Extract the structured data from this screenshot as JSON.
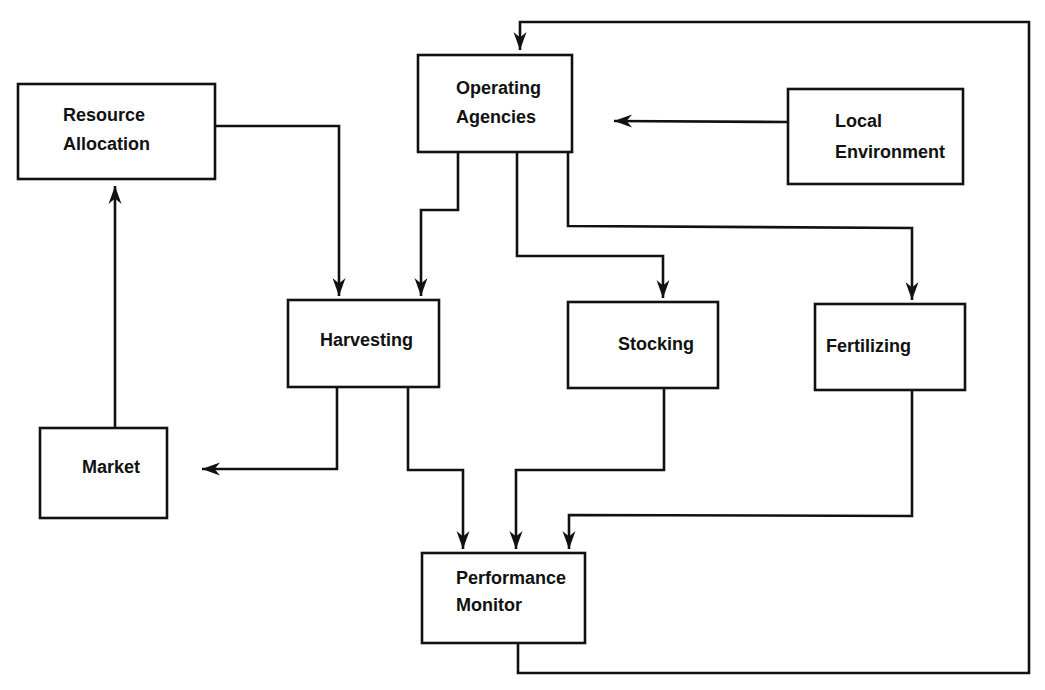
{
  "diagram": {
    "nodes": [
      {
        "id": "resource_allocation",
        "lines": [
          "Resource",
          "Allocation"
        ]
      },
      {
        "id": "operating_agencies",
        "lines": [
          "Operating",
          "Agencies"
        ]
      },
      {
        "id": "local_environment",
        "lines": [
          "Local",
          "Environment"
        ]
      },
      {
        "id": "harvesting",
        "lines": [
          "Harvesting"
        ]
      },
      {
        "id": "stocking",
        "lines": [
          "Stocking"
        ]
      },
      {
        "id": "fertilizing",
        "lines": [
          "Fertilizing"
        ]
      },
      {
        "id": "market",
        "lines": [
          "Market"
        ]
      },
      {
        "id": "performance_monitor",
        "lines": [
          "Performance",
          "Monitor"
        ]
      }
    ],
    "edges": [
      {
        "from": "resource_allocation",
        "to": "harvesting"
      },
      {
        "from": "operating_agencies",
        "to": "harvesting"
      },
      {
        "from": "operating_agencies",
        "to": "stocking"
      },
      {
        "from": "operating_agencies",
        "to": "fertilizing"
      },
      {
        "from": "local_environment",
        "to": "operating_agencies"
      },
      {
        "from": "harvesting",
        "to": "market"
      },
      {
        "from": "market",
        "to": "resource_allocation"
      },
      {
        "from": "harvesting",
        "to": "performance_monitor"
      },
      {
        "from": "stocking",
        "to": "performance_monitor"
      },
      {
        "from": "fertilizing",
        "to": "performance_monitor"
      },
      {
        "from": "performance_monitor",
        "to": "operating_agencies"
      }
    ]
  }
}
